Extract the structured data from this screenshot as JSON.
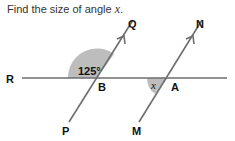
{
  "question": {
    "prefix": "Find the size of angle ",
    "variable": "x",
    "suffix": "."
  },
  "diagram": {
    "points": {
      "R": "R",
      "B": "B",
      "A": "A",
      "Q": "Q",
      "N": "N",
      "P": "P",
      "M": "M"
    },
    "given_angle": "125°",
    "unknown_angle": "x",
    "colors": {
      "line": "#6e6e6e",
      "shade": "#bdbdbd",
      "text": "#111111"
    }
  }
}
